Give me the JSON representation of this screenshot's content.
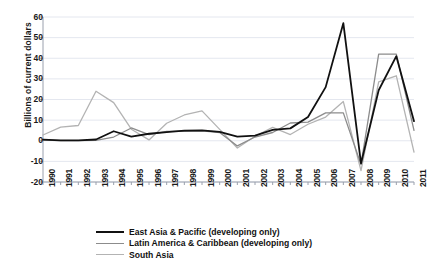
{
  "chart_data": {
    "type": "line",
    "title": "",
    "xlabel": "",
    "ylabel": "Billions of current dollars",
    "x": [
      1990,
      1991,
      1992,
      1993,
      1994,
      1995,
      1996,
      1997,
      1998,
      1999,
      2000,
      2001,
      2002,
      2003,
      2004,
      2005,
      2006,
      2007,
      2008,
      2009,
      2010,
      2011
    ],
    "categories": [
      "1990",
      "1991",
      "1992",
      "1993",
      "1994",
      "1995",
      "1996",
      "1997",
      "1998",
      "1999",
      "2000",
      "2001",
      "2002",
      "2003",
      "2004",
      "2005",
      "2006",
      "2007",
      "2008",
      "2009",
      "2010",
      "2011"
    ],
    "ylim": [
      -20,
      60
    ],
    "yticks": [
      -20,
      -10,
      0,
      10,
      20,
      30,
      40,
      50,
      60
    ],
    "ytick_labels": [
      "-20",
      "-10",
      "0",
      "10",
      "20",
      "30",
      "40",
      "50",
      "60"
    ],
    "grid": true,
    "legend_position": "bottom",
    "series": [
      {
        "name": "East Asia & Pacific (developing only)",
        "color": "#111111",
        "width": 1.8,
        "values": [
          0.5,
          0.2,
          0.2,
          0.6,
          4.6,
          2.0,
          3.4,
          4.2,
          4.9,
          5.0,
          4.3,
          2.0,
          2.5,
          5.3,
          6.0,
          11.5,
          26.0,
          57.0,
          -11.0,
          24.5,
          41.0,
          9.5
        ]
      },
      {
        "name": "Latin America & Caribbean (developing only)",
        "color": "#8c8c8c",
        "width": 1.3,
        "values": [
          0.3,
          0.1,
          0.1,
          0.2,
          1.8,
          6.2,
          3.0,
          4.5,
          4.6,
          4.8,
          4.0,
          -2.5,
          1.8,
          4.0,
          8.6,
          9.0,
          13.5,
          13.5,
          -11.5,
          42.0,
          42.0,
          5.0
        ]
      },
      {
        "name": "South Asia",
        "color": "#b3b3b3",
        "width": 1.3,
        "values": [
          2.8,
          6.6,
          7.4,
          24.0,
          18.5,
          5.6,
          0.4,
          8.5,
          12.5,
          14.5,
          5.5,
          -3.5,
          2.2,
          6.5,
          3.0,
          8.0,
          11.5,
          19.0,
          -14.5,
          28.5,
          31.5,
          -5.5
        ]
      }
    ]
  },
  "legend": {
    "items": [
      {
        "label": "East Asia & Pacific (developing only)",
        "color": "#111111",
        "thickness": 2.4
      },
      {
        "label": "Latin America & Caribbean (developing only)",
        "color": "#8c8c8c",
        "thickness": 1.4
      },
      {
        "label": "South Asia",
        "color": "#b3b3b3",
        "thickness": 1.4
      }
    ]
  },
  "axis": {
    "y_title": "Billions of current dollars"
  },
  "colors": {
    "grid": "#e4e7ef",
    "axis": "#9aa0ad",
    "text": "#1a1a1a",
    "background": "#ffffff"
  }
}
